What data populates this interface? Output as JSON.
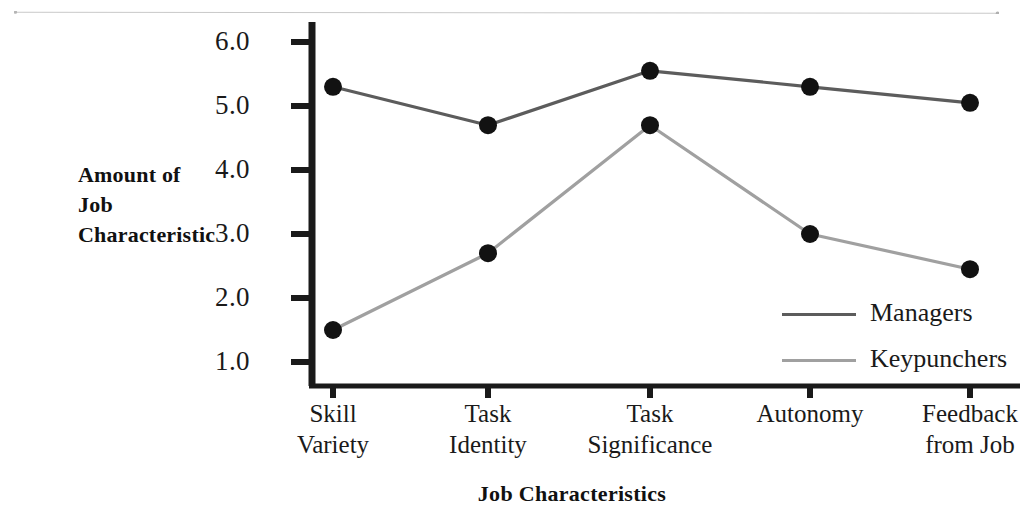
{
  "chart_data": {
    "type": "line",
    "title": "",
    "xlabel": "Job Characteristics",
    "ylabel": "Amount of Job Characteristic",
    "ylabel_lines": [
      "Amount of",
      "Job",
      "Characteristic"
    ],
    "categories": [
      "Skill Variety",
      "Task Identity",
      "Task Significance",
      "Autonomy",
      "Feedback from Job"
    ],
    "category_lines": [
      [
        "Skill",
        "Variety"
      ],
      [
        "Task",
        "Identity"
      ],
      [
        "Task",
        "Significance"
      ],
      [
        "Autonomy",
        ""
      ],
      [
        "Feedback",
        "from Job"
      ]
    ],
    "ylim": [
      0.5,
      6.3
    ],
    "yticks": [
      6.0,
      5.0,
      4.0,
      3.0,
      2.0,
      1.0
    ],
    "ytick_labels": [
      "6.0",
      "5.0",
      "4.0",
      "3.0",
      "2.0",
      "1.0"
    ],
    "grid": false,
    "legend_position": "inside-right",
    "series": [
      {
        "name": "Managers",
        "color": "#5c5c5c",
        "marker": "filled-circle",
        "marker_color": "#111111",
        "values": [
          5.3,
          4.7,
          5.55,
          5.3,
          5.05
        ]
      },
      {
        "name": "Keypunchers",
        "color": "#a0a0a0",
        "marker": "filled-circle",
        "marker_color": "#111111",
        "values": [
          1.5,
          2.7,
          4.7,
          3.0,
          2.45
        ]
      }
    ]
  },
  "axes": {
    "y_axis_color": "#1a1a1a",
    "x_axis_color": "#1a1a1a"
  },
  "legend": {
    "entries": [
      {
        "label": "Managers",
        "color": "#5c5c5c"
      },
      {
        "label": "Keypunchers",
        "color": "#a0a0a0"
      }
    ]
  }
}
